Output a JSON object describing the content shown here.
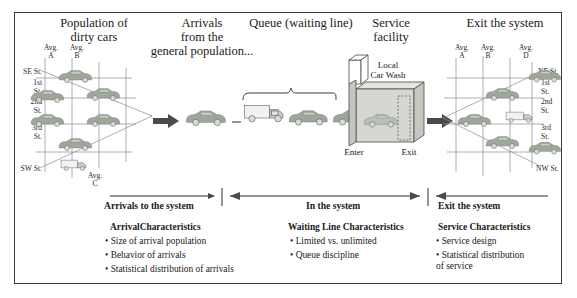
{
  "headers": {
    "population": "Population of\ndirty cars",
    "arrivals": "Arrivals\nfrom the\ngeneral population...",
    "queue": "Queue (waiting line)",
    "service": "Service\nfacility",
    "exit": "Exit the system"
  },
  "left_grid": {
    "col_labels": [
      {
        "line1": "Avg.",
        "line2": "A"
      },
      {
        "line1": "Avg.",
        "line2": "B"
      }
    ],
    "bottom_label": {
      "line1": "Avg.",
      "line2": "C"
    },
    "row_labels": [
      "SE St.",
      "1st\nSt.",
      "2nd\nSt.",
      "3rd\nSt.",
      "SW St."
    ]
  },
  "right_grid": {
    "col_labels": [
      {
        "line1": "Avg.",
        "line2": "A"
      },
      {
        "line1": "Avg.",
        "line2": "B"
      },
      {
        "line1": "Avg.",
        "line2": "D"
      }
    ],
    "row_labels": [
      "NE St.",
      "1st\nSt.",
      "2nd\nSt.",
      "3rd\nSt.",
      "NW St."
    ]
  },
  "facility": {
    "sign_line1": "Local",
    "sign_line2": "Car Wash",
    "enter_label": "Enter",
    "exit_label": "Exit"
  },
  "sections": [
    {
      "title": "Arrivals to the system",
      "heading": "ArrivalCharacteristics",
      "bullets": [
        "Size of arrival population",
        "Behavior of arrivals",
        "Statistical distribution of arrivals"
      ]
    },
    {
      "title": "In the system",
      "heading": "Waiting Line Characteristics",
      "bullets": [
        "Limited vs. unlimited",
        "Queue discipline"
      ]
    },
    {
      "title": "Exit the system",
      "heading": "Service Characteristics",
      "bullets": [
        "Service design",
        "Statistical distribution\nof service"
      ]
    }
  ],
  "colors": {
    "frame": "#3a3a3a",
    "grid": "#9a9aa0",
    "car": "#9fa79c",
    "arrow": "#4a4a4a"
  }
}
